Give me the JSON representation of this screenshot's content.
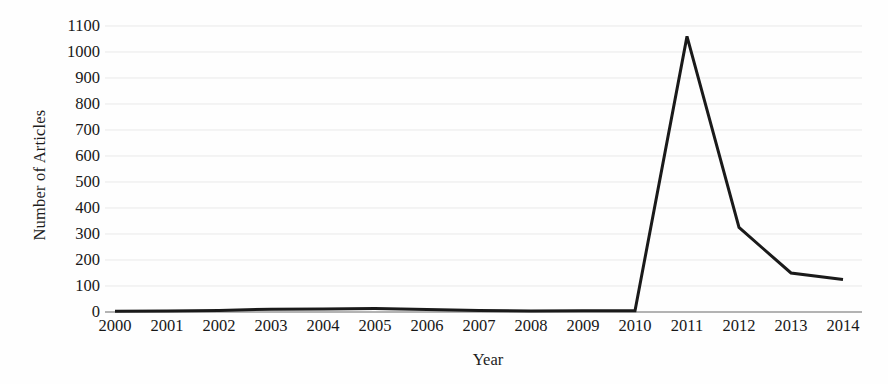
{
  "chart_data": {
    "type": "line",
    "title": "",
    "xlabel": "Year",
    "ylabel": "Number of Articles",
    "categories": [
      2000,
      2001,
      2002,
      2003,
      2004,
      2005,
      2006,
      2007,
      2008,
      2009,
      2010,
      2011,
      2012,
      2013,
      2014
    ],
    "x_tick_labels": [
      "2000",
      "2001",
      "2002",
      "2003",
      "2004",
      "2005",
      "2006",
      "2007",
      "2008",
      "2009",
      "2010",
      "2011",
      "2012",
      "2013",
      "2014"
    ],
    "values": [
      3,
      4,
      6,
      11,
      12,
      13,
      10,
      6,
      4,
      5,
      5,
      1060,
      325,
      150,
      125
    ],
    "series": [
      {
        "name": "Number of Articles",
        "values": [
          3,
          4,
          6,
          11,
          12,
          13,
          10,
          6,
          4,
          5,
          5,
          1060,
          325,
          150,
          125
        ]
      }
    ],
    "y_tick_labels": [
      "1100",
      "1000",
      "900",
      "800",
      "700",
      "600",
      "500",
      "400",
      "300",
      "200",
      "100",
      "0"
    ],
    "y_ticks": [
      1100,
      1000,
      900,
      800,
      700,
      600,
      500,
      400,
      300,
      200,
      100,
      0
    ],
    "ylim": [
      0,
      1100
    ],
    "xlim": [
      2000,
      2014
    ],
    "grid": false,
    "legend": false,
    "legend_position": "none",
    "line_color": "#1a1a1a",
    "line_width": 3,
    "axis_color": "#8a8a8a",
    "background_color": "#fefefe"
  },
  "axes": {
    "y_title": "Number of Articles",
    "x_title": "Year"
  }
}
